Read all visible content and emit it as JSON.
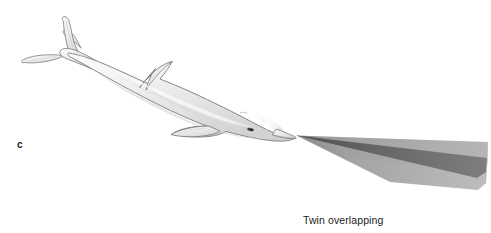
{
  "figure": {
    "panel_label": "c",
    "caption_line_1": "Twin overlapping",
    "caption_line_2": "beams of sound",
    "background_color": "#ffffff"
  },
  "colors": {
    "background": "#ffffff",
    "body_fill_light": "#f2f2f2",
    "body_fill_mid": "#dcdcdc",
    "body_fill_dark": "#c9c9c9",
    "body_outline": "#6e6e6e",
    "highlight": "#ffffff",
    "eye": "#2b2b2b",
    "beam_light": "#b4b4b4",
    "beam_mid": "#9a9a9a",
    "beam_overlap_dark": "#6a6a6a",
    "beam_overlap_darkest": "#555555",
    "text": "#1c1c1c",
    "panel_letter": "#1a1a1a"
  },
  "anatomy": {
    "tail_fluke": "tail-fluke",
    "dorsal_fin": "dorsal-fin",
    "pectoral_fin": "pectoral-fin",
    "melon": "melon",
    "rostrum": "rostrum",
    "eye": "eye",
    "body": "body"
  },
  "beams": {
    "origin_x": 296,
    "origin_y": 135,
    "count": 2,
    "upper_beam_name": "upper-sound-beam",
    "lower_beam_name": "lower-sound-beam",
    "overlap_name": "beam-overlap-region"
  }
}
